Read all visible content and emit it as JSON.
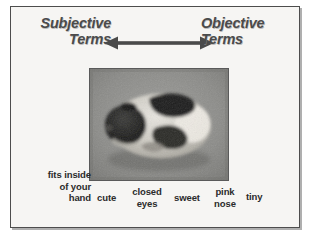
{
  "slide": {
    "background_color": "#f6f5f3",
    "border_color": "#4d4d4d"
  },
  "axis": {
    "left_pole": {
      "line1": "Subjective",
      "line2": "Terms"
    },
    "right_pole": {
      "line1": "Objective",
      "line2": "Terms"
    },
    "arrow": {
      "name": "double-headed-arrow",
      "direction": "both",
      "color": "#4a4a4a"
    },
    "text_color": "#4b4b4b"
  },
  "photo": {
    "alt": "grayscale photograph of a small curled-up guinea pig with black and white patches",
    "border_color": "#5a5a5a"
  },
  "labels": {
    "text_color": "#2b2b2b",
    "items": [
      {
        "id": "fits-inside-of-your-hand",
        "lines": [
          "fits inside",
          "of your",
          "hand"
        ]
      },
      {
        "id": "cute",
        "lines": [
          "cute"
        ]
      },
      {
        "id": "closed-eyes",
        "lines": [
          "closed",
          "eyes"
        ]
      },
      {
        "id": "sweet",
        "lines": [
          "sweet"
        ]
      },
      {
        "id": "pink-nose",
        "lines": [
          "pink",
          "nose"
        ]
      },
      {
        "id": "tiny",
        "lines": [
          "tiny"
        ]
      }
    ]
  }
}
